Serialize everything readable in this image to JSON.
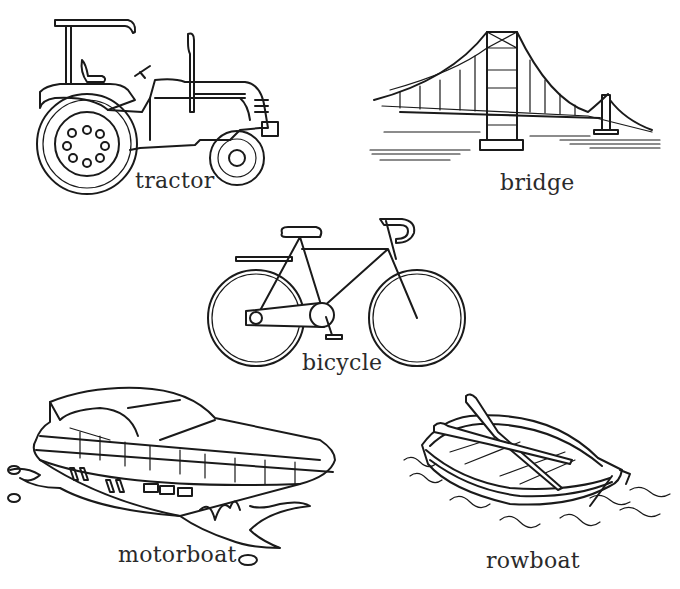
{
  "page": {
    "type": "vocabulary worksheet",
    "background": "#ffffff",
    "line_color": "#1a1a1a"
  },
  "items": [
    {
      "label": "tractor",
      "icon": "tractor-icon"
    },
    {
      "label": "bridge",
      "icon": "bridge-icon"
    },
    {
      "label": "bicycle",
      "icon": "bicycle-icon"
    },
    {
      "label": "motorboat",
      "icon": "motorboat-icon"
    },
    {
      "label": "rowboat",
      "icon": "rowboat-icon"
    }
  ]
}
